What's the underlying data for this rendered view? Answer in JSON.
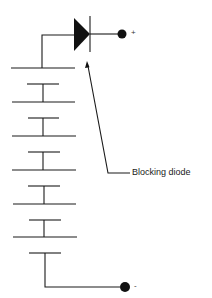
{
  "diagram": {
    "type": "circuit-schematic",
    "colors": {
      "line": "#1a1a1a",
      "background": "#ffffff"
    },
    "components": {
      "battery": {
        "cell_count": 6
      },
      "blocking_diode": {
        "label": "Blocking diode"
      },
      "positive_terminal": {
        "symbol": "+"
      },
      "negative_terminal": {
        "symbol": "-"
      }
    }
  }
}
